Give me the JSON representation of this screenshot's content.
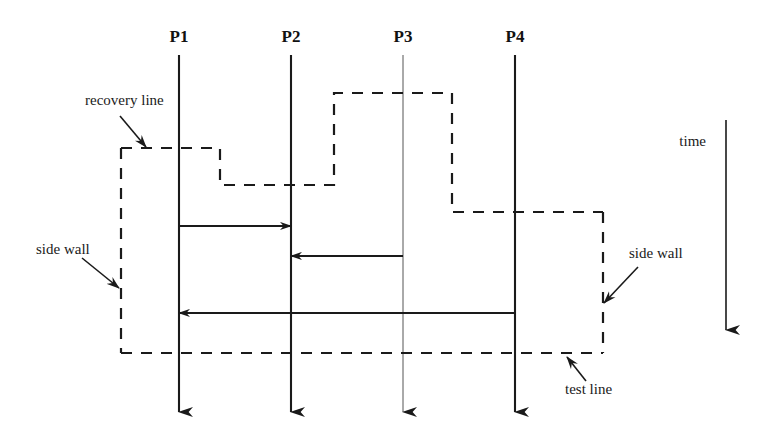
{
  "figure": {
    "type": "distributed-system-recovery-line-diagram",
    "width": 775,
    "height": 430,
    "background_color": "#ffffff",
    "line_color": "#1a1a1a"
  },
  "processes": [
    {
      "id": "P1",
      "label": "P1",
      "label_x": 179,
      "label_y": 42,
      "x": 179,
      "top_y": 55,
      "bottom_y": 412,
      "stroke_width": 2.1
    },
    {
      "id": "P2",
      "label": "P2",
      "label_x": 291,
      "label_y": 42,
      "x": 291,
      "top_y": 55,
      "bottom_y": 412,
      "stroke_width": 2.1
    },
    {
      "id": "P3",
      "label": "P3",
      "label_x": 403,
      "label_y": 42,
      "x": 403,
      "top_y": 55,
      "bottom_y": 412,
      "stroke_width": 1.0
    },
    {
      "id": "P4",
      "label": "P4",
      "label_x": 515,
      "label_y": 42,
      "x": 515,
      "top_y": 55,
      "bottom_y": 412,
      "stroke_width": 2.1
    }
  ],
  "messages": [
    {
      "id": "m1",
      "from": "P1",
      "to": "P2",
      "x1": 179,
      "x2": 291,
      "y": 226,
      "direction": "right"
    },
    {
      "id": "m2",
      "from": "P3",
      "to": "P2",
      "x1": 403,
      "x2": 291,
      "y": 256,
      "direction": "left"
    },
    {
      "id": "m3",
      "from": "P4",
      "to": "P1",
      "x1": 515,
      "x2": 179,
      "y": 313,
      "direction": "left"
    }
  ],
  "recovery_line": {
    "name": "recovery line",
    "style": "dashed",
    "points": "121,148 220,148 220,185 334,185 334,93 452,93 452,212 603,212"
  },
  "side_wall_left": {
    "name": "side wall",
    "style": "dashed",
    "points": "121,148 121,353"
  },
  "side_wall_right": {
    "name": "side wall",
    "style": "dashed",
    "points": "603,212 603,353"
  },
  "test_line": {
    "name": "test line",
    "style": "dashed",
    "points": "121,353 603,353"
  },
  "time_axis": {
    "label": "time",
    "label_x": 706,
    "label_y": 146,
    "x": 726,
    "top_y": 120,
    "bottom_y": 330
  },
  "annotations": [
    {
      "id": "recovery-line-annotation",
      "label": "recovery line",
      "text_x": 85,
      "text_y": 105,
      "anchor": "start",
      "arrow": {
        "x1": 120,
        "y1": 116,
        "x2": 146,
        "y2": 147
      }
    },
    {
      "id": "side-wall-left-annotation",
      "label": "side wall",
      "text_x": 36,
      "text_y": 254,
      "anchor": "start",
      "arrow": {
        "x1": 82,
        "y1": 258,
        "x2": 119,
        "y2": 288
      }
    },
    {
      "id": "side-wall-right-annotation",
      "label": "side wall",
      "text_x": 629,
      "text_y": 258,
      "anchor": "start",
      "arrow": {
        "x1": 638,
        "y1": 267,
        "x2": 604,
        "y2": 303
      }
    },
    {
      "id": "test-line-annotation",
      "label": "test line",
      "text_x": 565,
      "text_y": 394,
      "anchor": "start",
      "arrow": {
        "x1": 586,
        "y1": 381,
        "x2": 567,
        "y2": 357
      }
    }
  ]
}
